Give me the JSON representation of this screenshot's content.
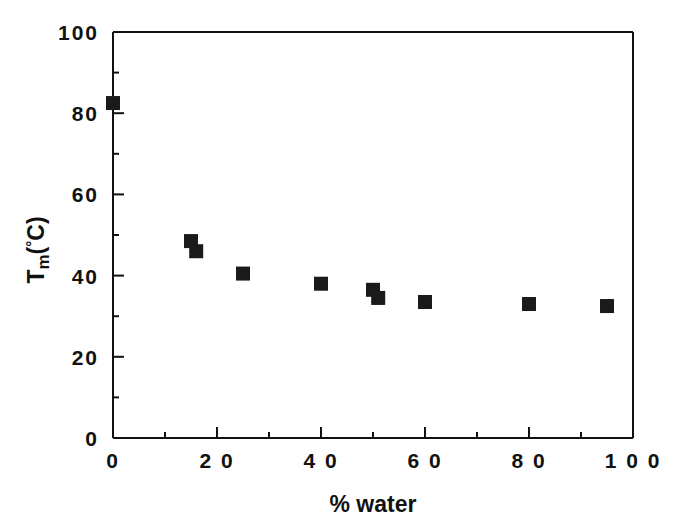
{
  "figure": {
    "background_color": "#ffffff",
    "foreground_color": "#111111",
    "marker_color": "#1a1a1a"
  },
  "axis": {
    "x_title": "% water",
    "y_title_main": "T",
    "y_title_sub": "m",
    "y_title_open_paren": "(",
    "y_title_degree": "°",
    "y_title_unit": "C",
    "y_title_close_paren": ")",
    "x_tick_labels": [
      "0",
      "2 0",
      "4 0",
      "6 0",
      "8 0",
      "1 0 0"
    ],
    "y_tick_labels": [
      "0",
      "20",
      "40",
      "60",
      "80",
      "100"
    ]
  },
  "chart_data": {
    "type": "scatter",
    "title": "",
    "xlabel": "% water",
    "ylabel": "Tm(°C)",
    "xlim": [
      0,
      100
    ],
    "ylim": [
      0,
      100
    ],
    "xticks": [
      0,
      20,
      40,
      60,
      80,
      100
    ],
    "yticks": [
      0,
      20,
      40,
      60,
      80,
      100
    ],
    "x_minor_ticks": [
      10,
      30,
      50,
      70,
      90
    ],
    "y_minor_ticks": [
      10,
      30,
      50,
      70,
      90
    ],
    "grid": false,
    "legend": false,
    "marker": "filled-square",
    "marker_color": "#1a1a1a",
    "marker_size_px": 14,
    "series": [
      {
        "name": "Tm vs % water",
        "points": [
          {
            "x": 0,
            "y": 82.5
          },
          {
            "x": 15,
            "y": 48.5
          },
          {
            "x": 16,
            "y": 46.0
          },
          {
            "x": 25,
            "y": 40.5
          },
          {
            "x": 40,
            "y": 38.0
          },
          {
            "x": 50,
            "y": 36.5
          },
          {
            "x": 51,
            "y": 34.5
          },
          {
            "x": 60,
            "y": 33.5
          },
          {
            "x": 80,
            "y": 33.0
          },
          {
            "x": 95,
            "y": 32.5
          }
        ]
      }
    ]
  }
}
